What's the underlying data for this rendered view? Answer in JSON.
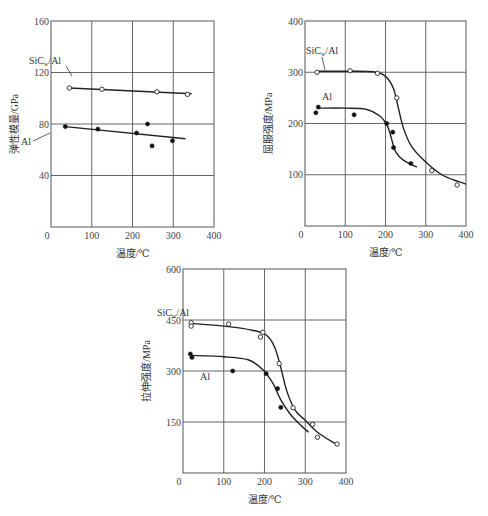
{
  "chart_data": [
    {
      "type": "line",
      "title": "",
      "xlabel": "温度/℃",
      "ylabel": "弹性模量/GPa",
      "xlim": [
        0,
        400
      ],
      "ylim": [
        0,
        160
      ],
      "xticks": [
        0,
        100,
        200,
        300,
        400
      ],
      "yticks": [
        40,
        80,
        120,
        160
      ],
      "grid": true,
      "series": [
        {
          "name": "SiCw/Al",
          "marker": "open-circle",
          "points": [
            [
              45,
              108
            ],
            [
              125,
              107
            ],
            [
              260,
              105
            ],
            [
              335,
              103
            ]
          ],
          "fit_line": [
            [
              45,
              108
            ],
            [
              345,
              103.5
            ]
          ]
        },
        {
          "name": "Al",
          "marker": "filled-circle",
          "points": [
            [
              35,
              78
            ],
            [
              115,
              76
            ],
            [
              210,
              73
            ],
            [
              237,
              80
            ],
            [
              248,
              63
            ],
            [
              298,
              67
            ]
          ],
          "fit_line": [
            [
              35,
              78
            ],
            [
              330,
              68.5
            ]
          ]
        }
      ]
    },
    {
      "type": "line",
      "title": "",
      "xlabel": "温度/℃",
      "ylabel": "屈服强度/MPa",
      "xlim": [
        0,
        400
      ],
      "ylim": [
        0,
        400
      ],
      "xticks": [
        0,
        100,
        200,
        300,
        400
      ],
      "yticks": [
        100,
        200,
        300,
        400
      ],
      "grid": true,
      "series": [
        {
          "name": "SiCw/Al",
          "marker": "open-circle",
          "points": [
            [
              30,
              300
            ],
            [
              112,
              303
            ],
            [
              180,
              298
            ],
            [
              228,
              250
            ],
            [
              315,
              108
            ],
            [
              378,
              80
            ]
          ],
          "curve": [
            [
              30,
              302
            ],
            [
              100,
              302
            ],
            [
              170,
              301
            ],
            [
              200,
              292
            ],
            [
              220,
              268
            ],
            [
              232,
              230
            ],
            [
              245,
              190
            ],
            [
              265,
              155
            ],
            [
              300,
              125
            ],
            [
              340,
              100
            ],
            [
              380,
              87
            ],
            [
              400,
              82
            ]
          ]
        },
        {
          "name": "Al",
          "marker": "filled-circle",
          "points": [
            [
              27,
              221
            ],
            [
              33,
              232
            ],
            [
              122,
              217
            ],
            [
              203,
              200
            ],
            [
              218,
              183
            ],
            [
              220,
              153
            ],
            [
              263,
              122
            ]
          ],
          "curve": [
            [
              30,
              230
            ],
            [
              100,
              230
            ],
            [
              150,
              228
            ],
            [
              185,
              215
            ],
            [
              205,
              195
            ],
            [
              215,
              170
            ],
            [
              225,
              145
            ],
            [
              245,
              128
            ],
            [
              278,
              115
            ]
          ]
        }
      ]
    },
    {
      "type": "line",
      "title": "",
      "xlabel": "温度/℃",
      "ylabel": "拉伸强度/MPa",
      "xlim": [
        0,
        400
      ],
      "ylim": [
        0,
        600
      ],
      "xticks": [
        0,
        100,
        200,
        300,
        400
      ],
      "yticks": [
        150,
        300,
        450,
        600
      ],
      "grid": true,
      "series": [
        {
          "name": "SiCw/Al",
          "marker": "open-circle",
          "points": [
            [
              20,
              442
            ],
            [
              20,
              432
            ],
            [
              112,
              438
            ],
            [
              190,
              400
            ],
            [
              196,
              414
            ],
            [
              236,
              322
            ],
            [
              270,
              192
            ],
            [
              318,
              143
            ],
            [
              330,
              105
            ],
            [
              378,
              85
            ]
          ],
          "curve": [
            [
              20,
              440
            ],
            [
              100,
              432
            ],
            [
              170,
              420
            ],
            [
              205,
              405
            ],
            [
              225,
              370
            ],
            [
              240,
              310
            ],
            [
              255,
              240
            ],
            [
              275,
              185
            ],
            [
              300,
              155
            ],
            [
              330,
              120
            ],
            [
              378,
              83
            ]
          ]
        },
        {
          "name": "Al",
          "marker": "filled-circle",
          "points": [
            [
              18,
              350
            ],
            [
              22,
              340
            ],
            [
              122,
              300
            ],
            [
              204,
              292
            ],
            [
              232,
              248
            ],
            [
              240,
              193
            ]
          ],
          "curve": [
            [
              20,
              346
            ],
            [
              100,
              342
            ],
            [
              160,
              333
            ],
            [
              195,
              305
            ],
            [
              220,
              265
            ],
            [
              240,
              215
            ],
            [
              262,
              175
            ],
            [
              285,
              145
            ],
            [
              308,
              120
            ]
          ]
        }
      ]
    }
  ],
  "charts": [
    {
      "ylabel": "弹性模量/GPa",
      "xlabel": "温度/℃",
      "label_a": "SiC",
      "label_a_sub": "w",
      "label_a_rest": "/Al",
      "label_b": "Al",
      "xticks": [
        "0",
        "100",
        "200",
        "300",
        "400"
      ],
      "yticks": [
        "40",
        "80",
        "120",
        "160"
      ]
    },
    {
      "ylabel": "屈服强度/MPa",
      "xlabel": "温度/℃",
      "label_a": "SiC",
      "label_a_sub": "w",
      "label_a_rest": "/Al",
      "label_b": "Al",
      "xticks": [
        "0",
        "100",
        "200",
        "300",
        "400"
      ],
      "yticks": [
        "100",
        "200",
        "300",
        "400"
      ]
    },
    {
      "ylabel": "拉伸强度/MPa",
      "xlabel": "温度/℃",
      "label_a": "SiC",
      "label_a_sub": "w",
      "label_a_rest": "/Al",
      "label_b": "Al",
      "xticks": [
        "0",
        "100",
        "200",
        "300",
        "400"
      ],
      "yticks": [
        "150",
        "300",
        "450",
        "600"
      ]
    }
  ],
  "colors": {
    "ink": "#222222",
    "grid": "#555555",
    "background": "#ffffff"
  }
}
